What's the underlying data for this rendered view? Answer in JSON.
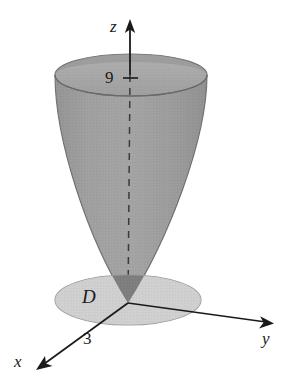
{
  "figure": {
    "axes": {
      "z_label": "z",
      "y_label": "y",
      "x_label": "x"
    },
    "annotations": {
      "height_tick_label": "9",
      "region_label": "D",
      "radius_label": "3"
    },
    "colors": {
      "surface_body": "#9a9a9a",
      "surface_rim_top": "#b0b0b0",
      "surface_rim_inner": "#a3a3a3",
      "disk_fill": "#cccccc",
      "occluded_vertex": "#7d7d7d",
      "stroke": "#1a1a1a",
      "edge_stroke": "#7a7a7a",
      "background": "#ffffff"
    },
    "geometry": {
      "origin": {
        "x": 128,
        "y": 303
      },
      "z_axis_top": {
        "x": 130,
        "y": 22
      },
      "top_rim_center": {
        "x": 131,
        "y": 75
      },
      "top_rim_rx": 76,
      "top_rim_ry": 21,
      "disk_center": {
        "x": 128,
        "y": 300
      },
      "disk_rx": 73,
      "disk_ry": 25,
      "tick_z_value": 9,
      "disk_radius_value": 3
    }
  }
}
